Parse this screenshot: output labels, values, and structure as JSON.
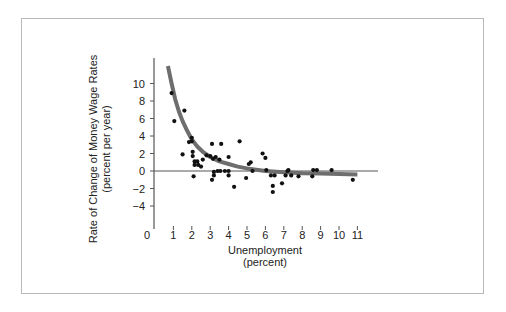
{
  "chart_data": {
    "type": "scatter",
    "title": "",
    "xlabel": "Unemployment",
    "xlabel_sub": "(percent)",
    "ylabel": "Rate of Change of Money Wage Rates",
    "ylabel_sub": "(percent per year)",
    "xlim": [
      0,
      11
    ],
    "ylim": [
      -5,
      12
    ],
    "x_ticks": [
      0,
      1,
      2,
      3,
      4,
      5,
      6,
      7,
      8,
      9,
      10,
      11
    ],
    "y_ticks": [
      -4,
      -2,
      0,
      2,
      4,
      6,
      8,
      10
    ],
    "grid": false,
    "legend": null,
    "series": [
      {
        "name": "Observations",
        "kind": "scatter",
        "points": [
          [
            0.9,
            8.9
          ],
          [
            1.05,
            5.7
          ],
          [
            1.6,
            6.9
          ],
          [
            1.5,
            1.9
          ],
          [
            1.85,
            3.3
          ],
          [
            2.0,
            3.8
          ],
          [
            2.0,
            3.4
          ],
          [
            2.05,
            2.2
          ],
          [
            2.05,
            1.7
          ],
          [
            2.15,
            1.1
          ],
          [
            2.3,
            1.1
          ],
          [
            2.15,
            0.7
          ],
          [
            2.35,
            0.7
          ],
          [
            2.1,
            -0.6
          ],
          [
            2.5,
            0.5
          ],
          [
            2.6,
            1.3
          ],
          [
            2.8,
            1.8
          ],
          [
            3.0,
            1.7
          ],
          [
            3.15,
            1.4
          ],
          [
            3.3,
            1.6
          ],
          [
            3.5,
            1.3
          ],
          [
            4.0,
            1.6
          ],
          [
            3.1,
            3.1
          ],
          [
            3.6,
            3.1
          ],
          [
            4.6,
            3.4
          ],
          [
            3.2,
            -0.1
          ],
          [
            3.4,
            0.0
          ],
          [
            3.55,
            0.0
          ],
          [
            3.8,
            0.0
          ],
          [
            4.0,
            0.0
          ],
          [
            3.2,
            -0.5
          ],
          [
            3.1,
            -1.0
          ],
          [
            4.0,
            -0.5
          ],
          [
            4.3,
            -1.8
          ],
          [
            5.1,
            0.8
          ],
          [
            5.2,
            1.0
          ],
          [
            5.3,
            0.0
          ],
          [
            4.95,
            -0.8
          ],
          [
            5.85,
            2.0
          ],
          [
            6.0,
            1.5
          ],
          [
            6.05,
            0.1
          ],
          [
            6.3,
            -0.5
          ],
          [
            6.5,
            -0.5
          ],
          [
            6.4,
            -1.7
          ],
          [
            6.4,
            -2.4
          ],
          [
            6.9,
            -1.4
          ],
          [
            7.2,
            0.0
          ],
          [
            7.25,
            0.1
          ],
          [
            7.1,
            -0.5
          ],
          [
            7.4,
            -0.5
          ],
          [
            7.8,
            -0.6
          ],
          [
            8.6,
            0.1
          ],
          [
            8.8,
            0.1
          ],
          [
            8.55,
            -0.6
          ],
          [
            9.6,
            0.1
          ],
          [
            10.75,
            -1.0
          ]
        ]
      },
      {
        "name": "Phillips curve (fitted)",
        "kind": "line",
        "points": [
          [
            0.7,
            12.0
          ],
          [
            0.9,
            10.0
          ],
          [
            1.1,
            8.2
          ],
          [
            1.3,
            6.8
          ],
          [
            1.5,
            5.7
          ],
          [
            1.75,
            4.6
          ],
          [
            2.0,
            3.6
          ],
          [
            2.3,
            2.8
          ],
          [
            2.6,
            2.2
          ],
          [
            3.0,
            1.6
          ],
          [
            3.5,
            1.1
          ],
          [
            4.0,
            0.8
          ],
          [
            4.5,
            0.5
          ],
          [
            5.0,
            0.3
          ],
          [
            5.5,
            0.15
          ],
          [
            6.0,
            0.0
          ],
          [
            7.0,
            -0.15
          ],
          [
            8.0,
            -0.25
          ],
          [
            9.0,
            -0.3
          ],
          [
            10.0,
            -0.35
          ],
          [
            11.0,
            -0.4
          ]
        ]
      }
    ]
  },
  "colors": {
    "axis": "#555555",
    "curve": "#6e6e6e",
    "points": "#111111",
    "frame": "#b8b8b8"
  }
}
